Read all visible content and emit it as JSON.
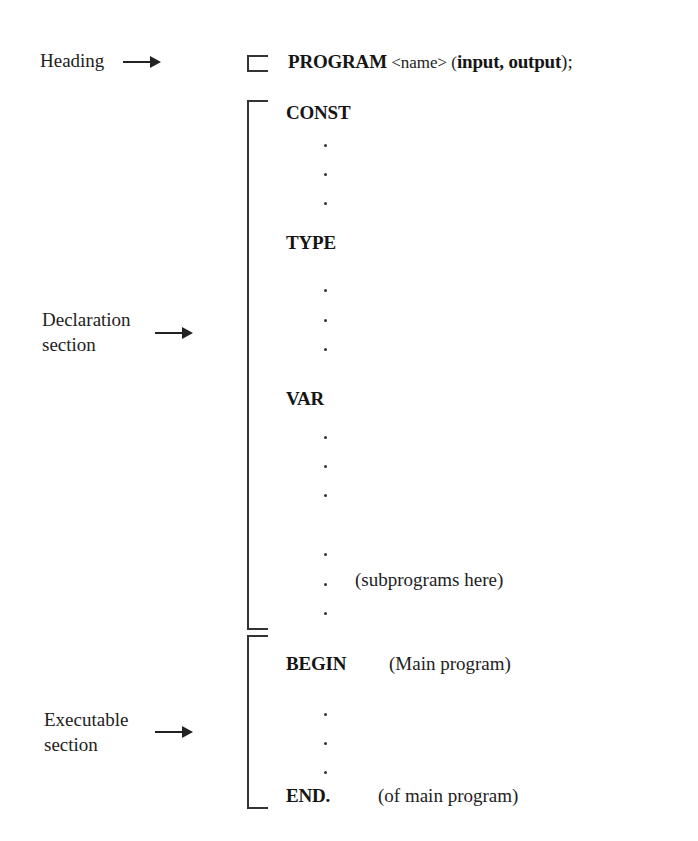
{
  "heading": {
    "label": "Heading",
    "program_keyword": "PROGRAM",
    "program_name": " <name> (",
    "program_params": "input, output",
    "program_end": ");"
  },
  "declaration": {
    "label_line1": "Declaration",
    "label_line2": "section",
    "const_keyword": "CONST",
    "type_keyword": "TYPE",
    "var_keyword": "VAR",
    "subprograms_note": "(subprograms here)"
  },
  "executable": {
    "label_line1": "Executable",
    "label_line2": "section",
    "begin_keyword": "BEGIN",
    "begin_note": "(Main program)",
    "end_keyword": "END.",
    "end_note": "(of main program)"
  },
  "dot_glyph": "."
}
